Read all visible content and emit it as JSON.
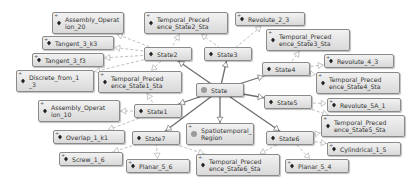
{
  "graph": {
    "nodes": [
      {
        "id": "assembly20",
        "label": "Assembly_Operat\nion_20",
        "type": "individual",
        "expandable": true,
        "x": 52,
        "y": 12,
        "w": 72,
        "h": 22
      },
      {
        "id": "tangent_k3",
        "label": "Tangent_3_k3",
        "type": "individual",
        "expandable": true,
        "x": 42,
        "y": 36,
        "w": 72,
        "h": 14
      },
      {
        "id": "tangent_f3",
        "label": "Tangent_3_f3",
        "type": "individual",
        "expandable": true,
        "x": 32,
        "y": 53,
        "w": 72,
        "h": 14
      },
      {
        "id": "discrete",
        "label": "Discrete_from_1\n_3",
        "type": "individual",
        "expandable": true,
        "x": 16,
        "y": 70,
        "w": 78,
        "h": 22
      },
      {
        "id": "tp_state2",
        "label": "Temporal_Preced\nence_State2_Sta",
        "type": "individual",
        "expandable": true,
        "x": 144,
        "y": 12,
        "w": 84,
        "h": 22
      },
      {
        "id": "state2",
        "label": "State2",
        "type": "class",
        "expandable": false,
        "x": 144,
        "y": 47,
        "w": 48,
        "h": 14
      },
      {
        "id": "state3",
        "label": "State3",
        "type": "class",
        "expandable": false,
        "x": 204,
        "y": 47,
        "w": 48,
        "h": 14
      },
      {
        "id": "revolute23",
        "label": "Revolute_2_3",
        "type": "individual",
        "expandable": true,
        "x": 235,
        "y": 12,
        "w": 70,
        "h": 14
      },
      {
        "id": "tp_state3",
        "label": "Temporal_Preced\nence_State3_Sta",
        "type": "individual",
        "expandable": true,
        "x": 266,
        "y": 29,
        "w": 84,
        "h": 22
      },
      {
        "id": "state4",
        "label": "State4",
        "type": "class",
        "expandable": false,
        "x": 262,
        "y": 62,
        "w": 48,
        "h": 14
      },
      {
        "id": "revolute43",
        "label": "Revolute_4_3",
        "type": "individual",
        "expandable": true,
        "x": 324,
        "y": 54,
        "w": 70,
        "h": 14
      },
      {
        "id": "tp_state4",
        "label": "Temporal_Preced\nence_State4_Sta",
        "type": "individual",
        "expandable": true,
        "x": 316,
        "y": 72,
        "w": 84,
        "h": 22
      },
      {
        "id": "tp_state1",
        "label": "Temporal_Preced\nence_State1_Sta",
        "type": "individual",
        "expandable": true,
        "x": 98,
        "y": 71,
        "w": 84,
        "h": 22
      },
      {
        "id": "state",
        "label": "State",
        "type": "root",
        "expandable": false,
        "x": 196,
        "y": 83,
        "w": 48,
        "h": 14
      },
      {
        "id": "state5",
        "label": "State5",
        "type": "class",
        "expandable": false,
        "x": 264,
        "y": 95,
        "w": 48,
        "h": 14
      },
      {
        "id": "revolute5a1",
        "label": "Revolute_5A_1",
        "type": "individual",
        "expandable": true,
        "x": 327,
        "y": 98,
        "w": 74,
        "h": 14
      },
      {
        "id": "tp_state5",
        "label": "Temporal_Preced\nence_State5_Sta",
        "type": "individual",
        "expandable": true,
        "x": 321,
        "y": 115,
        "w": 84,
        "h": 22
      },
      {
        "id": "assembly10",
        "label": "Assembly_Operat\nion_10",
        "type": "individual",
        "expandable": true,
        "x": 38,
        "y": 100,
        "w": 82,
        "h": 22
      },
      {
        "id": "state1",
        "label": "State1",
        "type": "class",
        "expandable": false,
        "x": 134,
        "y": 104,
        "w": 48,
        "h": 14
      },
      {
        "id": "overlap",
        "label": "Overlap_1_k1",
        "type": "individual",
        "expandable": true,
        "x": 53,
        "y": 130,
        "w": 72,
        "h": 14
      },
      {
        "id": "state7",
        "label": "State7",
        "type": "class",
        "expandable": false,
        "x": 132,
        "y": 131,
        "w": 48,
        "h": 14
      },
      {
        "id": "spatio",
        "label": "Spatiotemporal_\nRegion",
        "type": "root",
        "expandable": true,
        "x": 186,
        "y": 123,
        "w": 68,
        "h": 22
      },
      {
        "id": "state6",
        "label": "State6",
        "type": "class",
        "expandable": false,
        "x": 266,
        "y": 131,
        "w": 48,
        "h": 14
      },
      {
        "id": "cylindrical",
        "label": "Cylindrical_1_5",
        "type": "individual",
        "expandable": true,
        "x": 327,
        "y": 142,
        "w": 74,
        "h": 14
      },
      {
        "id": "screw",
        "label": "Screw_1_6",
        "type": "individual",
        "expandable": true,
        "x": 59,
        "y": 152,
        "w": 64,
        "h": 14
      },
      {
        "id": "planar56",
        "label": "Planar_5_6",
        "type": "individual",
        "expandable": true,
        "x": 126,
        "y": 159,
        "w": 64,
        "h": 14
      },
      {
        "id": "tp_state6",
        "label": "Temporal_Preced\nence_State6_Sta",
        "type": "individual",
        "expandable": true,
        "x": 196,
        "y": 154,
        "w": 84,
        "h": 22
      },
      {
        "id": "planar54",
        "label": "Planar_5_4",
        "type": "individual",
        "expandable": true,
        "x": 285,
        "y": 159,
        "w": 64,
        "h": 14
      }
    ],
    "edges": [
      {
        "from": "state",
        "to": "state2",
        "style": "solid"
      },
      {
        "from": "state",
        "to": "state3",
        "style": "solid"
      },
      {
        "from": "state",
        "to": "state4",
        "style": "solid"
      },
      {
        "from": "state",
        "to": "state5",
        "style": "solid"
      },
      {
        "from": "state",
        "to": "state1",
        "style": "solid"
      },
      {
        "from": "state",
        "to": "state7",
        "style": "solid"
      },
      {
        "from": "state",
        "to": "state6",
        "style": "solid"
      },
      {
        "from": "state",
        "to": "spatio",
        "style": "solid"
      },
      {
        "from": "state2",
        "to": "assembly20",
        "style": "dashed"
      },
      {
        "from": "state2",
        "to": "tangent_k3",
        "style": "dashed"
      },
      {
        "from": "state2",
        "to": "tangent_f3",
        "style": "dashed"
      },
      {
        "from": "state2",
        "to": "discrete",
        "style": "dashed"
      },
      {
        "from": "state2",
        "to": "tp_state2",
        "style": "dashed"
      },
      {
        "from": "state2",
        "to": "tp_state1",
        "style": "dashed"
      },
      {
        "from": "state3",
        "to": "revolute23",
        "style": "dashed"
      },
      {
        "from": "state3",
        "to": "tp_state2",
        "style": "dashed"
      },
      {
        "from": "state4",
        "to": "tp_state3",
        "style": "dashed"
      },
      {
        "from": "state4",
        "to": "revolute43",
        "style": "dashed"
      },
      {
        "from": "state4",
        "to": "tp_state4",
        "style": "dashed"
      },
      {
        "from": "state5",
        "to": "revolute5a1",
        "style": "dashed"
      },
      {
        "from": "state5",
        "to": "tp_state5",
        "style": "dashed"
      },
      {
        "from": "state1",
        "to": "tp_state1",
        "style": "dashed"
      },
      {
        "from": "state1",
        "to": "assembly10",
        "style": "dashed"
      },
      {
        "from": "state1",
        "to": "overlap",
        "style": "dashed"
      },
      {
        "from": "state7",
        "to": "screw",
        "style": "dashed"
      },
      {
        "from": "state7",
        "to": "planar56",
        "style": "dashed"
      },
      {
        "from": "state7",
        "to": "tp_state6",
        "style": "dashed"
      },
      {
        "from": "state6",
        "to": "tp_state5",
        "style": "dashed"
      },
      {
        "from": "state6",
        "to": "cylindrical",
        "style": "dashed"
      },
      {
        "from": "state6",
        "to": "planar54",
        "style": "dashed"
      },
      {
        "from": "state6",
        "to": "tp_state6",
        "style": "dashed"
      }
    ]
  },
  "colors": {
    "solid_edge": "#6e6e6e",
    "dashed_edge": "#b0b0b0",
    "node_border": "#8a8a8a",
    "root_dot": "#9a9a9a"
  }
}
